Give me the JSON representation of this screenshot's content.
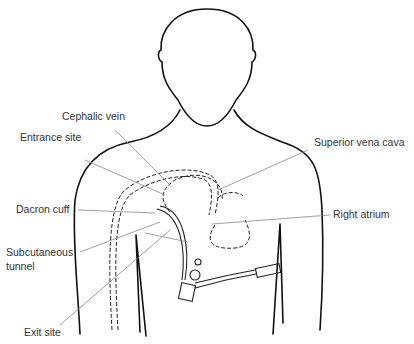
{
  "labels": {
    "cephalic_vein": "Cephalic vein",
    "entrance_site": "Entrance site",
    "superior_vena_cava": "Superior vena cava",
    "dacron_cuff": "Dacron cuff",
    "right_atrium": "Right atrium",
    "subcutaneous_tunnel_1": "Subcutaneous",
    "subcutaneous_tunnel_2": "tunnel",
    "exit_site": "Exit site"
  }
}
